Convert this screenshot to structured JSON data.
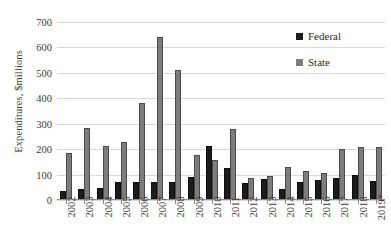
{
  "chart_data": {
    "type": "bar",
    "title": "",
    "xlabel": "",
    "ylabel": "Expenditures, $millions",
    "ylim": [
      0,
      700
    ],
    "ytick_step": 100,
    "yticks": [
      0,
      100,
      200,
      300,
      400,
      500,
      600,
      700
    ],
    "grid": "horizontal",
    "legend_position": "top-right",
    "categories": [
      "2002",
      "2003",
      "2004",
      "2005",
      "2006",
      "2007",
      "2008",
      "2009",
      "2010",
      "2011",
      "2012",
      "2013",
      "2014",
      "2015",
      "2016",
      "2017",
      "2018",
      "2019*"
    ],
    "series": [
      {
        "name": "Federal",
        "color": "#1c1c1c",
        "values": [
          37,
          44,
          46,
          71,
          69,
          71,
          71,
          91,
          212,
          124,
          65,
          83,
          42,
          69,
          79,
          85,
          99,
          74
        ]
      },
      {
        "name": "State",
        "color": "#7c7c7c",
        "values": [
          183,
          283,
          212,
          228,
          383,
          643,
          513,
          176,
          157,
          280,
          85,
          95,
          131,
          115,
          105,
          200,
          207,
          208
        ]
      }
    ]
  },
  "legend": {
    "items": [
      {
        "label": "Federal"
      },
      {
        "label": "State"
      }
    ]
  }
}
